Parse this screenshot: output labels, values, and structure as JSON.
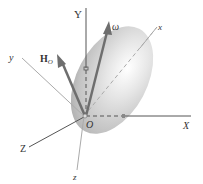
{
  "diagram": {
    "type": "rigid-body-rotation",
    "labels": {
      "Y": "Y",
      "X": "X",
      "Z": "Z",
      "x": "x",
      "y": "y",
      "z": "z",
      "O": "O",
      "omega": "ω",
      "H": "H",
      "H_sub": "O"
    },
    "colors": {
      "axis": "#555555",
      "body_axis": "#aaaaaa",
      "vector": "#6e6e6e",
      "body_light": "#f4f4f4",
      "body_dark": "#b8b8b8",
      "text": "#333333"
    }
  }
}
